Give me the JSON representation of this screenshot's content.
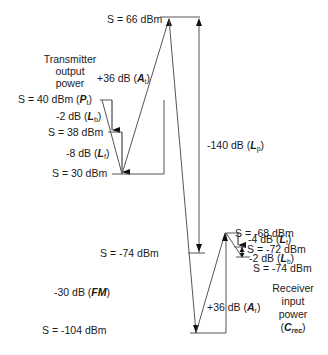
{
  "diagram": {
    "levels": {
      "top": "S = 66 dBm",
      "tx_pt": "S = 40 dBm (",
      "tx_pt_sym": "P",
      "tx_pt_sub": "t",
      "tx_38": "S = 38 dBm",
      "tx_30": "S = 30 dBm",
      "rx_m74": "S = -74 dBm",
      "rx_m104": "S = -104 dBm",
      "rx_m68": "S = -68 dBm",
      "rx_m72": "S = -72 dBm",
      "rx_m74b": "S = -74 dBm"
    },
    "gains": {
      "at": "+36 dB (",
      "at_sym": "A",
      "at_sub": "t",
      "lb_tx": "-2 dB (",
      "lb_tx_sym": "L",
      "lb_tx_sub": "b",
      "lf_tx": "-8 dB (",
      "lf_tx_sym": "L",
      "lf_tx_sub": "f",
      "lp": "-140 dB (",
      "lp_sym": "L",
      "lp_sub": "p",
      "fm": "-30 dB (",
      "fm_sym": "FM",
      "ar": "+36 dB (",
      "ar_sym": "A",
      "ar_sub": "r",
      "lf_rx": "-4 dB (",
      "lf_rx_sym": "L",
      "lf_rx_sub": "f",
      "lb_rx": "-2 dB (",
      "lb_rx_sym": "L",
      "lb_rx_sub": "b",
      "close": ")"
    },
    "labels": {
      "tx_line1": "Transmitter",
      "tx_line2": "output",
      "tx_line3": "power",
      "rx_line1": "Receiver",
      "rx_line2": "input",
      "rx_line3": "power",
      "rx_crec_open": "(",
      "rx_crec_sym": "C",
      "rx_crec_sub": "rec",
      "rx_crec_close": ")"
    }
  }
}
